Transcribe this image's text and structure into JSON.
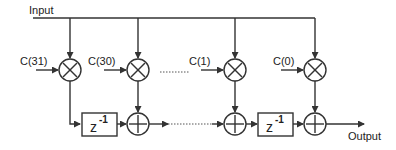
{
  "diagram": {
    "type": "FIR filter (transposed direct form)",
    "input_label": "Input",
    "output_label": "Output",
    "coefficients": [
      {
        "label": "C(31)"
      },
      {
        "label": "C(30)"
      },
      {
        "label": "C(1)"
      },
      {
        "label": "C(0)"
      }
    ],
    "delays": [
      {
        "label": "z",
        "exponent": "-1"
      },
      {
        "label": "z",
        "exponent": "-1"
      }
    ],
    "multiplier_symbol": "×",
    "adder_symbol": "+"
  }
}
